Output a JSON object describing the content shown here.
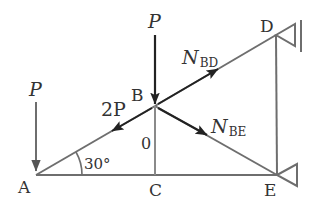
{
  "diagram": {
    "type": "truss free-body diagram",
    "colors": {
      "member": "#6e6e6e",
      "force": "#222222",
      "text": "#333333",
      "background": "#ffffff"
    },
    "nodes": {
      "A": {
        "label": "A",
        "x": 36,
        "y": 175
      },
      "B": {
        "label": "B",
        "x": 155,
        "y": 106
      },
      "C": {
        "label": "C",
        "x": 155,
        "y": 175
      },
      "D": {
        "label": "D",
        "x": 276,
        "y": 35
      },
      "E": {
        "label": "E",
        "x": 277,
        "y": 175
      }
    },
    "members": [
      {
        "id": "AB",
        "from": "A",
        "to": "B"
      },
      {
        "id": "BD",
        "from": "B",
        "to": "D"
      },
      {
        "id": "BE",
        "from": "B",
        "to": "E"
      },
      {
        "id": "BC",
        "from": "B",
        "to": "C"
      },
      {
        "id": "AC",
        "from": "A",
        "to": "C"
      },
      {
        "id": "CE",
        "from": "C",
        "to": "E"
      },
      {
        "id": "DE",
        "from": "D",
        "to": "E"
      }
    ],
    "supports": [
      {
        "node": "D",
        "type": "pin-to-wall"
      },
      {
        "node": "E",
        "type": "pin"
      }
    ],
    "loads": {
      "P_at_A": {
        "label": "P",
        "node": "A",
        "direction": "down"
      },
      "P_at_B": {
        "label": "P",
        "node": "B",
        "direction": "down"
      }
    },
    "member_forces": {
      "N_BD": {
        "symbol": "N",
        "subscript": "BD",
        "direction": "B toward D"
      },
      "N_BE": {
        "symbol": "N",
        "subscript": "BE",
        "direction": "B toward E"
      },
      "AB_force": {
        "label": "2P",
        "direction": "B toward A"
      },
      "BC_force": {
        "label": "0"
      }
    },
    "angle": {
      "at": "A",
      "value": "30",
      "unit": "°",
      "label": "30°"
    }
  }
}
